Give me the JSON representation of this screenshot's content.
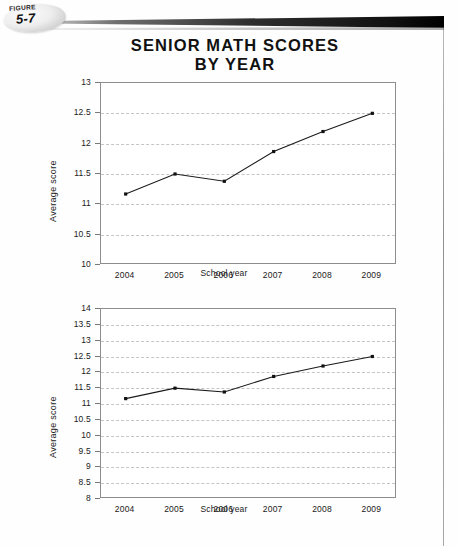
{
  "figure": {
    "word": "FIGURE",
    "number": "5-7"
  },
  "title": {
    "line1": "SENIOR MATH SCORES",
    "line2": "BY YEAR"
  },
  "colors": {
    "ink": "#111111",
    "frame": "#8d8d8d",
    "grid": "#c5c5c5",
    "line": "#1b1b1b"
  },
  "chart_data": [
    {
      "type": "line",
      "id": "top-chart",
      "title": "SENIOR MATH SCORES BY YEAR",
      "xlabel": "School year",
      "ylabel": "Average score",
      "categories": [
        "2004",
        "2005",
        "2006",
        "2007",
        "2008",
        "2009"
      ],
      "values": [
        11.17,
        11.5,
        11.38,
        11.87,
        12.2,
        12.5
      ],
      "ylim": [
        10,
        13
      ],
      "ytick_step": 0.5,
      "yticks": [
        "10",
        "10.5",
        "11",
        "11.5",
        "12",
        "12.5",
        "13"
      ],
      "grid": true,
      "legend": "none",
      "markers": true
    },
    {
      "type": "line",
      "id": "bottom-chart",
      "title": "",
      "xlabel": "School year",
      "ylabel": "Average score",
      "categories": [
        "2004",
        "2005",
        "2006",
        "2007",
        "2008",
        "2009"
      ],
      "values": [
        11.17,
        11.5,
        11.38,
        11.87,
        12.2,
        12.5
      ],
      "ylim": [
        8,
        14
      ],
      "ytick_step": 0.5,
      "yticks": [
        "8",
        "8.5",
        "9",
        "9.5",
        "10",
        "10.5",
        "11",
        "11.5",
        "12",
        "12.5",
        "13",
        "13.5",
        "14"
      ],
      "grid": true,
      "legend": "none",
      "markers": true
    }
  ]
}
